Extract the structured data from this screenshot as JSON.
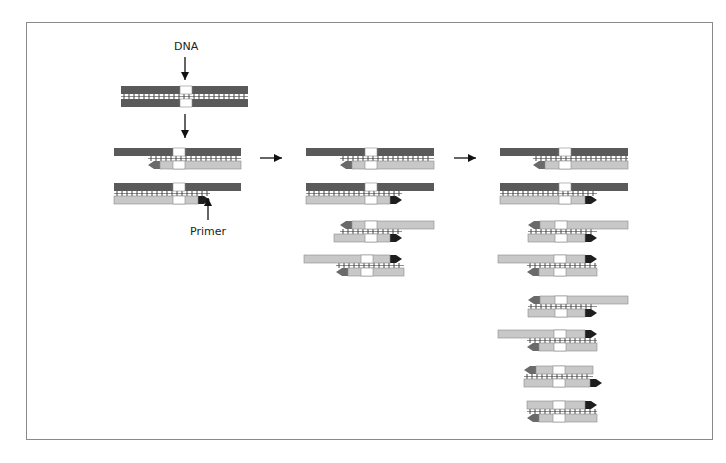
{
  "diagram": {
    "labels": {
      "dna": "DNA",
      "primer": "Primer"
    },
    "colors": {
      "template_strand": "#5a5a5a",
      "new_strand": "#c8c8c8",
      "target_region": "#ffffff",
      "primer_forward": "#1e1e1e",
      "primer_reverse": "#6a6a6a",
      "hydrogen_bonds": "#444444",
      "frame_border": "#8a8a8a"
    },
    "stages": [
      {
        "name": "stage-0-original",
        "duplexes": [
          {
            "top": {
              "x1": 121,
              "x2": 248,
              "type": "template"
            },
            "bottom": {
              "x1": 121,
              "x2": 248,
              "type": "template"
            },
            "y": 86,
            "bond": [
              121,
              248
            ],
            "target": [
              180,
              192
            ]
          }
        ]
      },
      {
        "name": "stage-1-cycle-1",
        "duplexes": [
          {
            "top": {
              "x1": 114,
              "x2": 241,
              "type": "template"
            },
            "bottom": {
              "x1": 148,
              "x2": 241,
              "type": "new",
              "primer": "left"
            },
            "y": 148,
            "bond": [
              148,
              241
            ],
            "target": [
              173,
              185
            ]
          },
          {
            "top": {
              "x1": 114,
              "x2": 241,
              "type": "template"
            },
            "bottom": {
              "x1": 114,
              "x2": 210,
              "type": "new",
              "primer": "right"
            },
            "y": 183,
            "bond": [
              114,
              210
            ],
            "target": [
              173,
              185
            ]
          }
        ]
      },
      {
        "name": "stage-2-cycle-2",
        "duplexes": [
          {
            "top": {
              "x1": 306,
              "x2": 434,
              "type": "template"
            },
            "bottom": {
              "x1": 340,
              "x2": 434,
              "type": "new",
              "primer": "left"
            },
            "y": 148,
            "bond": [
              340,
              434
            ],
            "target": [
              365,
              377
            ]
          },
          {
            "top": {
              "x1": 306,
              "x2": 434,
              "type": "template"
            },
            "bottom": {
              "x1": 306,
              "x2": 402,
              "type": "new",
              "primer": "right"
            },
            "y": 183,
            "bond": [
              306,
              402
            ],
            "target": [
              365,
              377
            ]
          },
          {
            "top": {
              "x1": 340,
              "x2": 434,
              "type": "new",
              "primer": "left"
            },
            "bottom": {
              "x1": 334,
              "x2": 402,
              "type": "new",
              "primer": "right"
            },
            "y": 221,
            "bond": [
              340,
              402
            ],
            "target": [
              365,
              377
            ]
          },
          {
            "top": {
              "x1": 304,
              "x2": 402,
              "type": "new",
              "primer": "right"
            },
            "bottom": {
              "x1": 336,
              "x2": 404,
              "type": "new",
              "primer": "left"
            },
            "y": 255,
            "bond": [
              336,
              404
            ],
            "target": [
              361,
              373
            ]
          }
        ]
      },
      {
        "name": "stage-3-cycle-3",
        "duplexes": [
          {
            "top": {
              "x1": 500,
              "x2": 628,
              "type": "template"
            },
            "bottom": {
              "x1": 533,
              "x2": 628,
              "type": "new",
              "primer": "left"
            },
            "y": 148,
            "bond": [
              533,
              628
            ],
            "target": [
              559,
              571
            ]
          },
          {
            "top": {
              "x1": 500,
              "x2": 628,
              "type": "template"
            },
            "bottom": {
              "x1": 500,
              "x2": 597,
              "type": "new",
              "primer": "right"
            },
            "y": 183,
            "bond": [
              500,
              597
            ],
            "target": [
              559,
              571
            ]
          },
          {
            "top": {
              "x1": 528,
              "x2": 628,
              "type": "new",
              "primer": "left"
            },
            "bottom": {
              "x1": 528,
              "x2": 597,
              "type": "new",
              "primer": "right"
            },
            "y": 221,
            "bond": [
              528,
              597
            ],
            "target": [
              555,
              567
            ]
          },
          {
            "top": {
              "x1": 498,
              "x2": 597,
              "type": "new",
              "primer": "right"
            },
            "bottom": {
              "x1": 527,
              "x2": 597,
              "type": "new",
              "primer": "left"
            },
            "y": 255,
            "bond": [
              527,
              597
            ],
            "target": [
              554,
              566
            ]
          },
          {
            "top": {
              "x1": 528,
              "x2": 628,
              "type": "new",
              "primer": "left"
            },
            "bottom": {
              "x1": 528,
              "x2": 597,
              "type": "new",
              "primer": "right"
            },
            "y": 296,
            "bond": [
              528,
              597
            ],
            "target": [
              555,
              567
            ]
          },
          {
            "top": {
              "x1": 498,
              "x2": 597,
              "type": "new",
              "primer": "right"
            },
            "bottom": {
              "x1": 527,
              "x2": 597,
              "type": "new",
              "primer": "left"
            },
            "y": 330,
            "bond": [
              527,
              597
            ],
            "target": [
              554,
              566
            ]
          },
          {
            "top": {
              "x1": 524,
              "x2": 593,
              "type": "new",
              "primer": "left"
            },
            "bottom": {
              "x1": 524,
              "x2": 602,
              "type": "new",
              "primer": "right"
            },
            "y": 366,
            "bond": [
              524,
              593
            ],
            "target": [
              553,
              565
            ]
          },
          {
            "top": {
              "x1": 527,
              "x2": 597,
              "type": "new",
              "primer": "right"
            },
            "bottom": {
              "x1": 527,
              "x2": 597,
              "type": "new",
              "primer": "left"
            },
            "y": 401,
            "bond": [
              527,
              597
            ],
            "target": [
              553,
              565
            ]
          }
        ]
      }
    ],
    "arrows": [
      {
        "name": "dna-pointer-arrow",
        "x1": 185,
        "y1": 57,
        "x2": 185,
        "y2": 80,
        "dir": "down"
      },
      {
        "name": "denature-arrow",
        "x1": 185,
        "y1": 114,
        "x2": 185,
        "y2": 138,
        "dir": "down"
      },
      {
        "name": "primer-pointer-arrow",
        "x1": 208,
        "y1": 220,
        "x2": 208,
        "y2": 198,
        "dir": "up"
      },
      {
        "name": "cycle-1-to-2-arrow",
        "x1": 260,
        "y1": 158,
        "x2": 282,
        "y2": 158,
        "dir": "right"
      },
      {
        "name": "cycle-2-to-3-arrow",
        "x1": 454,
        "y1": 158,
        "x2": 476,
        "y2": 158,
        "dir": "right"
      }
    ],
    "label_positions": {
      "dna": {
        "x": 174,
        "y": 40
      },
      "primer": {
        "x": 190,
        "y": 225
      }
    }
  }
}
